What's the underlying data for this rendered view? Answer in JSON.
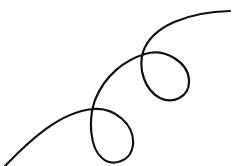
{
  "drawing": {
    "description": "Hand-drawn black curve with two loops rising from bottom-left to top-right",
    "stroke_color": "#111111",
    "background_color": "#ffffff",
    "stroke_width": 2.2,
    "path": "M 5 166 C 30 140, 60 112, 93 109 C 115 107, 135 125, 133 145 C 131 162, 112 167, 102 158 C 90 148, 88 120, 95 100 C 105 75, 125 60, 145 54 C 165 48, 188 62, 189 80 C 190 98, 172 104, 160 98 C 145 90, 138 70, 143 52 C 152 25, 190 12, 230 11"
  }
}
